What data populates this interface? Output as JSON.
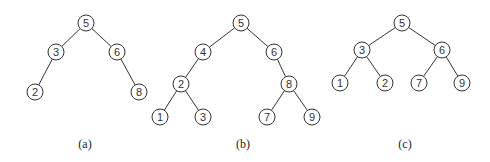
{
  "figure": {
    "node_radius": 8,
    "stroke_color": "#333333",
    "trees": [
      {
        "id": "a",
        "caption": "(a)",
        "caption_pos": [
          85,
          148
        ],
        "nodes": [
          {
            "id": "a5",
            "label": "5",
            "x": 86,
            "y": 23
          },
          {
            "id": "a3",
            "label": "3",
            "x": 56,
            "y": 52
          },
          {
            "id": "a6",
            "label": "6",
            "x": 117,
            "y": 52
          },
          {
            "id": "a2",
            "label": "2",
            "x": 35,
            "y": 92
          },
          {
            "id": "a8",
            "label": "8",
            "x": 139,
            "y": 92
          }
        ],
        "edges": [
          [
            "a5",
            "a3"
          ],
          [
            "a5",
            "a6"
          ],
          [
            "a3",
            "a2"
          ],
          [
            "a6",
            "a8"
          ]
        ]
      },
      {
        "id": "b",
        "caption": "(b)",
        "caption_pos": [
          243,
          148
        ],
        "nodes": [
          {
            "id": "b5",
            "label": "5",
            "x": 241,
            "y": 23
          },
          {
            "id": "b4",
            "label": "4",
            "x": 203,
            "y": 52
          },
          {
            "id": "b6",
            "label": "6",
            "x": 274,
            "y": 52
          },
          {
            "id": "b2",
            "label": "2",
            "x": 181,
            "y": 84
          },
          {
            "id": "b8",
            "label": "8",
            "x": 289,
            "y": 84
          },
          {
            "id": "b1",
            "label": "1",
            "x": 160,
            "y": 117
          },
          {
            "id": "b3",
            "label": "3",
            "x": 203,
            "y": 117
          },
          {
            "id": "b7",
            "label": "7",
            "x": 267,
            "y": 117
          },
          {
            "id": "b9",
            "label": "9",
            "x": 312,
            "y": 117
          }
        ],
        "edges": [
          [
            "b5",
            "b4"
          ],
          [
            "b5",
            "b6"
          ],
          [
            "b4",
            "b2"
          ],
          [
            "b6",
            "b8"
          ],
          [
            "b2",
            "b1"
          ],
          [
            "b2",
            "b3"
          ],
          [
            "b8",
            "b7"
          ],
          [
            "b8",
            "b9"
          ]
        ]
      },
      {
        "id": "c",
        "caption": "(c)",
        "caption_pos": [
          405,
          148
        ],
        "nodes": [
          {
            "id": "c5",
            "label": "5",
            "x": 402,
            "y": 23
          },
          {
            "id": "c3",
            "label": "3",
            "x": 362,
            "y": 50
          },
          {
            "id": "c6",
            "label": "6",
            "x": 442,
            "y": 50
          },
          {
            "id": "c1",
            "label": "1",
            "x": 340,
            "y": 83
          },
          {
            "id": "c2",
            "label": "2",
            "x": 385,
            "y": 83
          },
          {
            "id": "c7",
            "label": "7",
            "x": 419,
            "y": 83
          },
          {
            "id": "c9",
            "label": "9",
            "x": 462,
            "y": 83
          }
        ],
        "edges": [
          [
            "c5",
            "c3"
          ],
          [
            "c5",
            "c6"
          ],
          [
            "c3",
            "c1"
          ],
          [
            "c3",
            "c2"
          ],
          [
            "c6",
            "c7"
          ],
          [
            "c6",
            "c9"
          ]
        ]
      }
    ]
  }
}
